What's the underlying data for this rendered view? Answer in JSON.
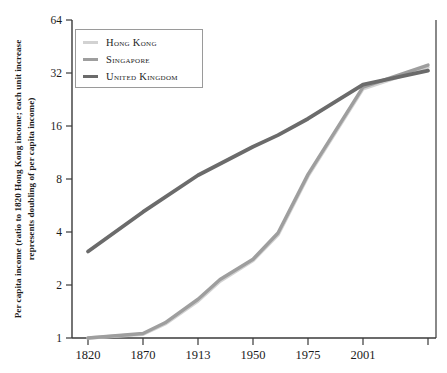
{
  "chart_data": {
    "type": "line",
    "title": "",
    "xlabel": "",
    "ylabel": "Per capita income (ratio to 1820 Hong Kong income; each unit increase represents doubling of per capita income)",
    "yscale": "log2",
    "ylim": [
      1,
      64
    ],
    "yticks": [
      1,
      2,
      4,
      8,
      16,
      32,
      64
    ],
    "ytick_labels": [
      "1",
      "2",
      "4",
      "8",
      "16",
      "32",
      "64"
    ],
    "categories": [
      "1820",
      "1870",
      "1913",
      "1950",
      "1975",
      "2001",
      ""
    ],
    "xtick_labels": [
      "1820",
      "1870",
      "1913",
      "1950",
      "1975",
      "2001"
    ],
    "grid": false,
    "legend_position": "upper-left",
    "series": [
      {
        "name": "Hong Kong",
        "color": "#d2d2d2",
        "x": [
          "1820",
          "1870",
          "1890",
          "1913",
          "1930",
          "1950",
          "1962",
          "1975",
          "2001",
          "2010"
        ],
        "values": [
          1.0,
          1.05,
          1.2,
          1.62,
          2.1,
          2.75,
          3.85,
          8.3,
          26.0,
          34.5
        ]
      },
      {
        "name": "Singapore",
        "color": "#9e9e9e",
        "x": [
          "1820",
          "1870",
          "1890",
          "1913",
          "1930",
          "1950",
          "1962",
          "1975",
          "2001",
          "2010"
        ],
        "values": [
          1.0,
          1.06,
          1.22,
          1.66,
          2.15,
          2.8,
          3.95,
          8.5,
          26.6,
          35.5
        ]
      },
      {
        "name": "United Kingdom",
        "color": "#6b6b6b",
        "x": [
          "1820",
          "1870",
          "1913",
          "1950",
          "1962",
          "1975",
          "2001",
          "2010"
        ],
        "values": [
          3.1,
          5.2,
          8.4,
          12.2,
          14.2,
          17.6,
          27.5,
          33.0
        ]
      }
    ]
  },
  "legend": {
    "items": [
      {
        "label": "Hong Kong",
        "color": "#d2d2d2"
      },
      {
        "label": "Singapore",
        "color": "#9e9e9e"
      },
      {
        "label": "United Kingdom",
        "color": "#6b6b6b"
      }
    ]
  },
  "axes": {
    "y_label": "Per capita income (ratio to 1820 Hong Kong income; each unit increase represents doubling of per capita income)",
    "y_ticks": [
      "64",
      "32",
      "16",
      "8",
      "4",
      "2",
      "1"
    ],
    "x_ticks": [
      "1820",
      "1870",
      "1913",
      "1950",
      "1975",
      "2001"
    ]
  },
  "colors": {
    "axis": "#3a3a3a",
    "text": "#1b1b1b",
    "legend_border": "#9a9a9a",
    "background": "#ffffff"
  }
}
